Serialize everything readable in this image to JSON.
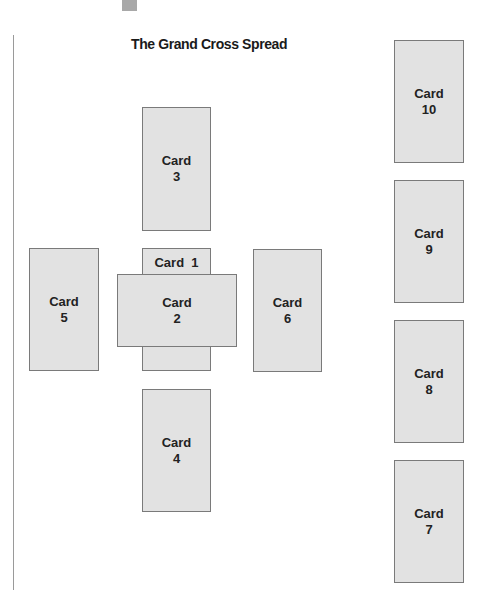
{
  "title": "The Grand Cross Spread",
  "colors": {
    "card_fill": "#e2e2e2",
    "card_border": "#7a7a7a",
    "text": "#222222",
    "rule": "#9a9a9a",
    "marker": "#a8a8a8"
  },
  "cards": [
    {
      "id": 1,
      "word": "Card",
      "number": "1",
      "label": "Card  1",
      "orientation": "vertical",
      "position": "center (under card 2)"
    },
    {
      "id": 2,
      "word": "Card",
      "number": "2",
      "orientation": "horizontal",
      "position": "center (crossing card 1)"
    },
    {
      "id": 3,
      "word": "Card",
      "number": "3",
      "orientation": "vertical",
      "position": "above center"
    },
    {
      "id": 4,
      "word": "Card",
      "number": "4",
      "orientation": "vertical",
      "position": "below center"
    },
    {
      "id": 5,
      "word": "Card",
      "number": "5",
      "orientation": "vertical",
      "position": "left of center"
    },
    {
      "id": 6,
      "word": "Card",
      "number": "6",
      "orientation": "vertical",
      "position": "right of center"
    },
    {
      "id": 7,
      "word": "Card",
      "number": "7",
      "orientation": "vertical",
      "position": "staff bottom"
    },
    {
      "id": 8,
      "word": "Card",
      "number": "8",
      "orientation": "vertical",
      "position": "staff third"
    },
    {
      "id": 9,
      "word": "Card",
      "number": "9",
      "orientation": "vertical",
      "position": "staff second"
    },
    {
      "id": 10,
      "word": "Card",
      "number": "10",
      "orientation": "vertical",
      "position": "staff top"
    }
  ]
}
